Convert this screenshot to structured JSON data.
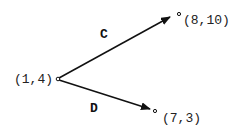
{
  "diagram": {
    "origin": {
      "label": "(1,4)"
    },
    "vectors": [
      {
        "name": "C",
        "label": "C",
        "end_label": "(8,10)"
      },
      {
        "name": "D",
        "label": "D",
        "end_label": "(7,3)"
      }
    ],
    "colors": {
      "line": "#111111",
      "text": "#222222",
      "background": "#ffffff"
    }
  }
}
